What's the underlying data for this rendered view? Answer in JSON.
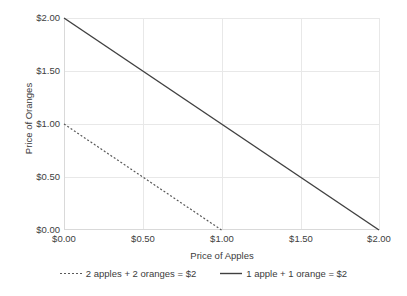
{
  "chart_data": {
    "type": "line",
    "title": "",
    "xlabel": "Price of Apples",
    "ylabel": "Price of Oranges",
    "xlim": [
      0,
      2
    ],
    "ylim": [
      0,
      2
    ],
    "grid": true,
    "legend_position": "bottom",
    "xticks": [
      "$0.00",
      "$0.50",
      "$1.00",
      "$1.50",
      "$2.00"
    ],
    "xtick_values": [
      0,
      0.5,
      1.0,
      1.5,
      2.0
    ],
    "yticks": [
      "$0.00",
      "$0.50",
      "$1.00",
      "$1.50",
      "$2.00"
    ],
    "ytick_values": [
      0,
      0.5,
      1.0,
      1.5,
      2.0
    ],
    "series": [
      {
        "name": "2 apples + 2 oranges = $2",
        "style": "dashed",
        "color": "#595959",
        "x": [
          0,
          1.0
        ],
        "values": [
          1.0,
          0
        ]
      },
      {
        "name": "1 apple + 1 orange = $2",
        "style": "solid",
        "color": "#404040",
        "x": [
          0,
          2.0
        ],
        "values": [
          2.0,
          0
        ]
      }
    ]
  },
  "legend": {
    "items": [
      {
        "label": "2 apples + 2 oranges = $2"
      },
      {
        "label": "1 apple + 1 orange = $2"
      }
    ]
  }
}
